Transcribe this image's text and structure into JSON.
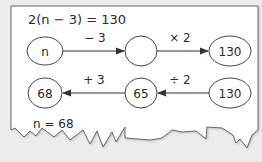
{
  "equation": "2(n − 3) = 130",
  "top_row": {
    "nodes": [
      "n",
      "",
      "130"
    ],
    "operations": [
      "− 3",
      "× 2"
    ]
  },
  "bottom_row": {
    "nodes": [
      "68",
      "65",
      "130"
    ],
    "operations": [
      "+ 3",
      "÷ 2"
    ]
  },
  "answer": "n = 68",
  "colors": {
    "background": "#ececec",
    "paper": "#ffffff",
    "stroke": "#555555",
    "text": "#2a2a2a"
  }
}
